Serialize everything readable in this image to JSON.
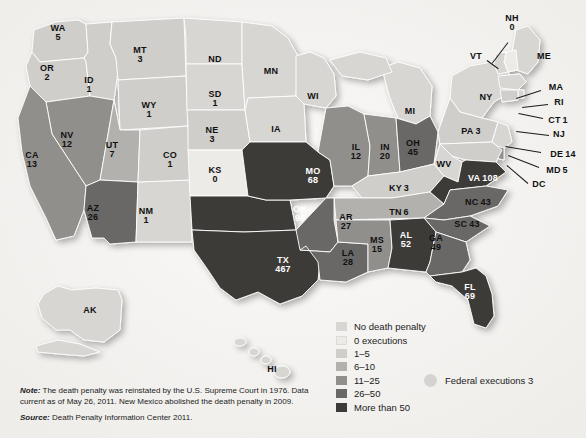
{
  "map": {
    "title": "Death Penalty Executions by State",
    "projection": "usa-albers",
    "background_color": "#f3f2f0"
  },
  "legend": {
    "title": "",
    "items": [
      {
        "label": "No death penalty",
        "color": "#d7d6d3"
      },
      {
        "label": "0 executions",
        "color": "#ecebe8"
      },
      {
        "label": "1–5",
        "color": "#cfcecb"
      },
      {
        "label": "6–10",
        "color": "#b2b1ae"
      },
      {
        "label": "11–25",
        "color": "#918f8c"
      },
      {
        "label": "26–50",
        "color": "#6a6866"
      },
      {
        "label": "More than 50",
        "color": "#3d3b39"
      }
    ],
    "federal": {
      "label": "Federal executions 3",
      "marker_color": "#d4d3d1"
    }
  },
  "footnotes": {
    "note_prefix": "Note:",
    "note_text": " The death penalty was reinstated by the U.S. Supreme Court in 1976. Data current as of May 26, 2011. New Mexico abolished the death penalty in 2009.",
    "source_prefix": "Source:",
    "source_text": " Death Penalty Information Center 2011."
  },
  "chart_data": {
    "type": "map",
    "unit": "executions since 1976",
    "categories": [
      "No death penalty",
      "0 executions",
      "1–5",
      "6–10",
      "11–25",
      "26–50",
      "More than 50"
    ],
    "states": [
      {
        "abbr": "WA",
        "value": "5",
        "bucket": "1–5",
        "color": "#cfcecb",
        "x": 58,
        "y": 33,
        "label_style": "dark",
        "layout": "stack"
      },
      {
        "abbr": "OR",
        "value": "2",
        "bucket": "1–5",
        "color": "#cfcecb",
        "x": 47,
        "y": 73,
        "label_style": "dark",
        "layout": "stack"
      },
      {
        "abbr": "ID",
        "value": "1",
        "bucket": "1–5",
        "color": "#cfcecb",
        "x": 89,
        "y": 85,
        "label_style": "dark",
        "layout": "stack"
      },
      {
        "abbr": "MT",
        "value": "3",
        "bucket": "1–5",
        "color": "#cfcecb",
        "x": 140,
        "y": 55,
        "label_style": "dark",
        "layout": "stack"
      },
      {
        "abbr": "WY",
        "value": "1",
        "bucket": "1–5",
        "color": "#cfcecb",
        "x": 149,
        "y": 110,
        "label_style": "dark",
        "layout": "stack"
      },
      {
        "abbr": "NV",
        "value": "12",
        "bucket": "11–25",
        "color": "#918f8c",
        "x": 67,
        "y": 140,
        "label_style": "dark",
        "layout": "stack"
      },
      {
        "abbr": "UT",
        "value": "7",
        "bucket": "6–10",
        "color": "#b2b1ae",
        "x": 112,
        "y": 150,
        "label_style": "dark",
        "layout": "stack"
      },
      {
        "abbr": "CA",
        "value": "13",
        "bucket": "11–25",
        "color": "#918f8c",
        "x": 32,
        "y": 160,
        "label_style": "dark",
        "layout": "stack"
      },
      {
        "abbr": "AZ",
        "value": "26",
        "bucket": "26–50",
        "color": "#6a6866",
        "x": 93,
        "y": 213,
        "label_style": "dark",
        "layout": "stack"
      },
      {
        "abbr": "NM",
        "value": "1",
        "bucket": "No death penalty",
        "color": "#d7d6d3",
        "x": 146,
        "y": 216,
        "label_style": "dark",
        "layout": "stack"
      },
      {
        "abbr": "CO",
        "value": "1",
        "bucket": "1–5",
        "color": "#cfcecb",
        "x": 170,
        "y": 160,
        "label_style": "dark",
        "layout": "stack"
      },
      {
        "abbr": "ND",
        "value": "",
        "bucket": "No death penalty",
        "color": "#d7d6d3",
        "x": 215,
        "y": 60,
        "label_style": "dark",
        "layout": "stack"
      },
      {
        "abbr": "SD",
        "value": "1",
        "bucket": "1–5",
        "color": "#cfcecb",
        "x": 215,
        "y": 99,
        "label_style": "dark",
        "layout": "stack"
      },
      {
        "abbr": "NE",
        "value": "3",
        "bucket": "1–5",
        "color": "#cfcecb",
        "x": 212,
        "y": 135,
        "label_style": "dark",
        "layout": "stack"
      },
      {
        "abbr": "KS",
        "value": "0",
        "bucket": "0 executions",
        "color": "#ecebe8",
        "x": 215,
        "y": 175,
        "label_style": "dark",
        "layout": "stack"
      },
      {
        "abbr": "MN",
        "value": "",
        "bucket": "No death penalty",
        "color": "#d7d6d3",
        "x": 271,
        "y": 72,
        "label_style": "dark",
        "layout": "stack"
      },
      {
        "abbr": "WI",
        "value": "",
        "bucket": "No death penalty",
        "color": "#d7d6d3",
        "x": 313,
        "y": 97,
        "label_style": "dark",
        "layout": "stack"
      },
      {
        "abbr": "IA",
        "value": "",
        "bucket": "No death penalty",
        "color": "#d7d6d3",
        "x": 276,
        "y": 130,
        "label_style": "dark",
        "layout": "stack"
      },
      {
        "abbr": "MO",
        "value": "68",
        "bucket": "More than 50",
        "color": "#3d3b39",
        "x": 313,
        "y": 176,
        "label_style": "light",
        "layout": "stack"
      },
      {
        "abbr": "OK",
        "value": "96",
        "bucket": "More than 50",
        "color": "#3d3b39",
        "x": 300,
        "y": 214,
        "label_style": "light",
        "layout": "stack"
      },
      {
        "abbr": "TX",
        "value": "467",
        "bucket": "More than 50",
        "color": "#3d3b39",
        "x": 283,
        "y": 265,
        "label_style": "light",
        "layout": "stack"
      },
      {
        "abbr": "AR",
        "value": "27",
        "bucket": "26–50",
        "color": "#6a6866",
        "x": 346,
        "y": 222,
        "label_style": "dark",
        "layout": "stack"
      },
      {
        "abbr": "LA",
        "value": "28",
        "bucket": "26–50",
        "color": "#6a6866",
        "x": 348,
        "y": 258,
        "label_style": "dark",
        "layout": "stack"
      },
      {
        "abbr": "MS",
        "value": "15",
        "bucket": "11–25",
        "color": "#918f8c",
        "x": 377,
        "y": 245,
        "label_style": "dark",
        "layout": "stack"
      },
      {
        "abbr": "AL",
        "value": "52",
        "bucket": "More than 50",
        "color": "#3d3b39",
        "x": 406,
        "y": 240,
        "label_style": "light",
        "layout": "stack"
      },
      {
        "abbr": "GA",
        "value": "49",
        "bucket": "26–50",
        "color": "#6a6866",
        "x": 436,
        "y": 243,
        "label_style": "dark",
        "layout": "stack"
      },
      {
        "abbr": "FL",
        "value": "69",
        "bucket": "More than 50",
        "color": "#3d3b39",
        "x": 470,
        "y": 292,
        "label_style": "light",
        "layout": "stack"
      },
      {
        "abbr": "IL",
        "value": "12",
        "bucket": "11–25",
        "color": "#918f8c",
        "x": 356,
        "y": 152,
        "label_style": "dark",
        "layout": "stack"
      },
      {
        "abbr": "IN",
        "value": "20",
        "bucket": "11–25",
        "color": "#918f8c",
        "x": 385,
        "y": 152,
        "label_style": "dark",
        "layout": "stack"
      },
      {
        "abbr": "OH",
        "value": "45",
        "bucket": "26–50",
        "color": "#6a6866",
        "x": 413,
        "y": 148,
        "label_style": "dark",
        "layout": "stack"
      },
      {
        "abbr": "MI",
        "value": "",
        "bucket": "No death penalty",
        "color": "#d7d6d3",
        "x": 410,
        "y": 112,
        "label_style": "dark",
        "layout": "stack"
      },
      {
        "abbr": "KY",
        "value": "3",
        "bucket": "1–5",
        "color": "#cfcecb",
        "x": 399,
        "y": 186,
        "label_style": "dark",
        "layout": "inline"
      },
      {
        "abbr": "TN",
        "value": "6",
        "bucket": "6–10",
        "color": "#b2b1ae",
        "x": 399,
        "y": 210,
        "label_style": "dark",
        "layout": "inline"
      },
      {
        "abbr": "WV",
        "value": "",
        "bucket": "No death penalty",
        "color": "#d7d6d3",
        "x": 444,
        "y": 165,
        "label_style": "dark",
        "layout": "stack"
      },
      {
        "abbr": "VA",
        "value": "108",
        "bucket": "More than 50",
        "color": "#3d3b39",
        "x": 483,
        "y": 176,
        "label_style": "light",
        "layout": "inline"
      },
      {
        "abbr": "NC",
        "value": "43",
        "bucket": "26–50",
        "color": "#6a6866",
        "x": 478,
        "y": 200,
        "label_style": "dark",
        "layout": "inline"
      },
      {
        "abbr": "SC",
        "value": "43",
        "bucket": "26–50",
        "color": "#6a6866",
        "x": 467,
        "y": 222,
        "label_style": "dark",
        "layout": "inline"
      },
      {
        "abbr": "PA",
        "value": "3",
        "bucket": "1–5",
        "color": "#cfcecb",
        "x": 471,
        "y": 129,
        "label_style": "dark",
        "layout": "inline"
      },
      {
        "abbr": "NY",
        "value": "",
        "bucket": "No death penalty",
        "color": "#d7d6d3",
        "x": 486,
        "y": 98,
        "label_style": "dark",
        "layout": "stack"
      },
      {
        "abbr": "AK",
        "value": "",
        "bucket": "No death penalty",
        "color": "#d7d6d3",
        "x": 90,
        "y": 311,
        "label_style": "dark",
        "layout": "stack"
      },
      {
        "abbr": "HI",
        "value": "",
        "bucket": "No death penalty",
        "color": "#d7d6d3",
        "x": 272,
        "y": 370,
        "label_style": "dark",
        "layout": "stack"
      }
    ],
    "callouts": [
      {
        "abbr": "NH",
        "value": "0",
        "bucket": "0 executions",
        "color": "#ecebe8",
        "x": 512,
        "y": 23,
        "layout": "stack",
        "line": {
          "x1": 508,
          "y1": 42,
          "x2": 492,
          "y2": 63
        }
      },
      {
        "abbr": "VT",
        "value": "",
        "bucket": "No death penalty",
        "color": "#d7d6d3",
        "x": 476,
        "y": 57,
        "layout": "stack",
        "line": {
          "x1": 487,
          "y1": 60,
          "x2": 498,
          "y2": 68
        }
      },
      {
        "abbr": "ME",
        "value": "",
        "bucket": "No death penalty",
        "color": "#d7d6d3",
        "x": 544,
        "y": 57,
        "layout": "stack",
        "line": null
      },
      {
        "abbr": "MA",
        "value": "",
        "bucket": "No death penalty",
        "color": "#d7d6d3",
        "x": 556,
        "y": 88,
        "layout": "stack",
        "line": {
          "x1": 541,
          "y1": 90,
          "x2": 516,
          "y2": 98
        }
      },
      {
        "abbr": "RI",
        "value": "",
        "bucket": "No death penalty",
        "color": "#d7d6d3",
        "x": 559,
        "y": 103,
        "layout": "stack",
        "line": {
          "x1": 548,
          "y1": 104,
          "x2": 522,
          "y2": 107
        }
      },
      {
        "abbr": "CT",
        "value": "1",
        "bucket": "1–5",
        "color": "#cfcecb",
        "x": 558,
        "y": 118,
        "layout": "inline",
        "line": {
          "x1": 543,
          "y1": 118,
          "x2": 519,
          "y2": 113
        }
      },
      {
        "abbr": "NJ",
        "value": "",
        "bucket": "No death penalty",
        "color": "#d7d6d3",
        "x": 559,
        "y": 135,
        "layout": "stack",
        "line": {
          "x1": 549,
          "y1": 135,
          "x2": 516,
          "y2": 131
        }
      },
      {
        "abbr": "DE",
        "value": "14",
        "bucket": "11–25",
        "color": "#918f8c",
        "x": 563,
        "y": 152,
        "layout": "inline",
        "line": {
          "x1": 541,
          "y1": 152,
          "x2": 505,
          "y2": 146
        }
      },
      {
        "abbr": "MD",
        "value": "5",
        "bucket": "1–5",
        "color": "#cfcecb",
        "x": 557,
        "y": 168,
        "layout": "inline",
        "line": {
          "x1": 539,
          "y1": 167,
          "x2": 508,
          "y2": 155
        }
      },
      {
        "abbr": "DC",
        "value": "",
        "bucket": "No death penalty",
        "color": "#d7d6d3",
        "x": 539,
        "y": 185,
        "layout": "stack",
        "line": {
          "x1": 528,
          "y1": 183,
          "x2": 507,
          "y2": 165
        }
      }
    ]
  }
}
